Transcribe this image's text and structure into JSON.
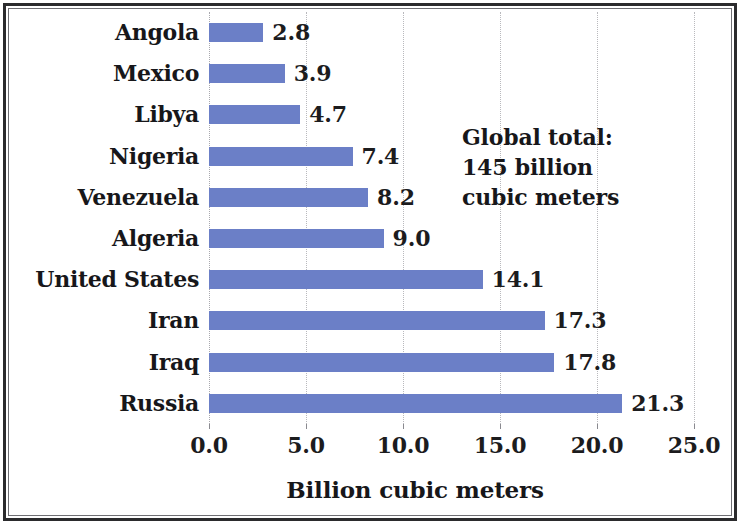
{
  "chart_data": {
    "type": "bar",
    "orientation": "horizontal",
    "title": "",
    "xlabel": "Billion cubic meters",
    "ylabel": "",
    "xlim": [
      0.0,
      25.0
    ],
    "xticks": [
      "0.0",
      "5.0",
      "10.0",
      "15.0",
      "20.0",
      "25.0"
    ],
    "xtick_values": [
      0,
      5,
      10,
      15,
      20,
      25
    ],
    "grid": "vertical dotted gridlines at each x tick",
    "legend": "none",
    "bar_color": "#6b7fc7",
    "categories": [
      "Angola",
      "Mexico",
      "Libya",
      "Nigeria",
      "Venezuela",
      "Algeria",
      "United States",
      "Iran",
      "Iraq",
      "Russia"
    ],
    "values": [
      2.8,
      3.9,
      4.7,
      7.4,
      8.2,
      9.0,
      14.1,
      17.3,
      17.8,
      21.3
    ],
    "value_labels": [
      "2.8",
      "3.9",
      "4.7",
      "7.4",
      "8.2",
      "9.0",
      "14.1",
      "17.3",
      "17.8",
      "21.3"
    ],
    "annotations": [
      {
        "lines": [
          "Global total:",
          "145 billion",
          "cubic meters"
        ]
      }
    ]
  },
  "annotation": {
    "line1": "Global total:",
    "line2": "145 billion",
    "line3": "cubic meters"
  },
  "axis": {
    "x_title": "Billion cubic meters"
  }
}
